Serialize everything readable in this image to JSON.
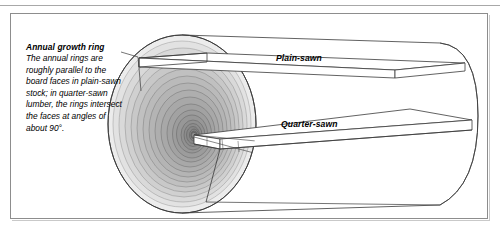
{
  "figure": {
    "type": "technical-illustration",
    "callout": {
      "title": "Annual growth ring",
      "body": "The annual rings are roughly parallel to the board faces in plain-sawn stock; in quarter-sawn lumber, the rings intersect the faces at angles of about 90°."
    },
    "labels": {
      "plain_sawn": "Plain-sawn",
      "quarter_sawn": "Quarter-sawn"
    },
    "colors": {
      "frame_border": "#8d8d8d",
      "frame_shadow": "#c9c9c9",
      "outline": "#3a3a3a",
      "log_face_light": "#e8e8e8",
      "log_face_mid": "#c4c4c4",
      "log_face_dark": "#8f8f8f",
      "pith": "#7a7a7a",
      "board_fill": "#ffffff",
      "text": "#000000",
      "background": "#ffffff"
    },
    "geometry": {
      "ring_count": 18,
      "log_center": [
        182,
        124
      ],
      "log_radius_x": 74,
      "log_radius_y": 89
    }
  }
}
